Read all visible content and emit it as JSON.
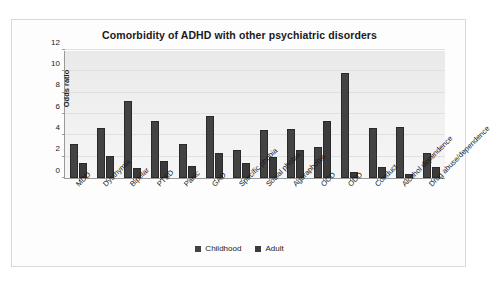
{
  "chart_data": {
    "type": "bar",
    "title": "Comorbidity of ADHD with other psychiatric disorders",
    "xlabel": "",
    "ylabel": "Odds ratio",
    "ylim": [
      0,
      12
    ],
    "yticks": [
      0,
      2,
      4,
      6,
      8,
      10,
      12
    ],
    "grid": true,
    "legend_position": "bottom",
    "categories": [
      "MDD",
      "Dysthymia",
      "Bipolar",
      "PTSD",
      "Panic",
      "GAD",
      "Specific phobia",
      "Social phobia",
      "Agoraphobia",
      "OCD",
      "ODD",
      "Conduct",
      "Alcohol dependence",
      "Drug abuse/dependence"
    ],
    "series": [
      {
        "name": "Childhood",
        "color": "#434343",
        "values": [
          3.2,
          4.7,
          7.2,
          5.3,
          3.2,
          5.8,
          2.6,
          4.5,
          4.6,
          2.9,
          9.8,
          4.7,
          4.8,
          2.3
        ]
      },
      {
        "name": "Adult",
        "color": "#3b3b3b",
        "values": [
          1.4,
          2.1,
          0.9,
          1.6,
          1.1,
          2.3,
          1.4,
          2.0,
          2.6,
          5.3,
          0.6,
          1.0,
          0.4,
          1.0
        ]
      }
    ]
  },
  "legend": {
    "items": [
      {
        "label": "Childhood"
      },
      {
        "label": "Adult"
      }
    ]
  }
}
